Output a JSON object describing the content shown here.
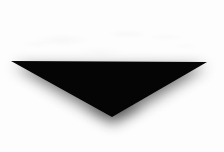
{
  "image": {
    "kind": "photograph-of-object",
    "subject_name": "black-inverted-triangle",
    "orientation_label": "pointing down",
    "canvas": {
      "width": 224,
      "height": 152
    },
    "background_color": "#fdfdfd",
    "shape_color": "#050505",
    "shadow_color": "#1a1a1a",
    "alt_text": "A solid black downward-pointing triangle centered on a plain white background, with a soft gray shadow falling beneath its lower edges."
  },
  "geometry": {
    "triangle_points": "11,61 207,62 112,117",
    "vertices": [
      {
        "name": "left-vertex",
        "x": 11,
        "y": 61
      },
      {
        "name": "right-vertex",
        "x": 207,
        "y": 62
      },
      {
        "name": "bottom-apex",
        "x": 112,
        "y": 117
      }
    ],
    "shadow_points": "14,66 206,67 113,124",
    "top_edge_y_center": 59,
    "top_edge_y_left": 61,
    "top_edge_y_right": 62
  }
}
